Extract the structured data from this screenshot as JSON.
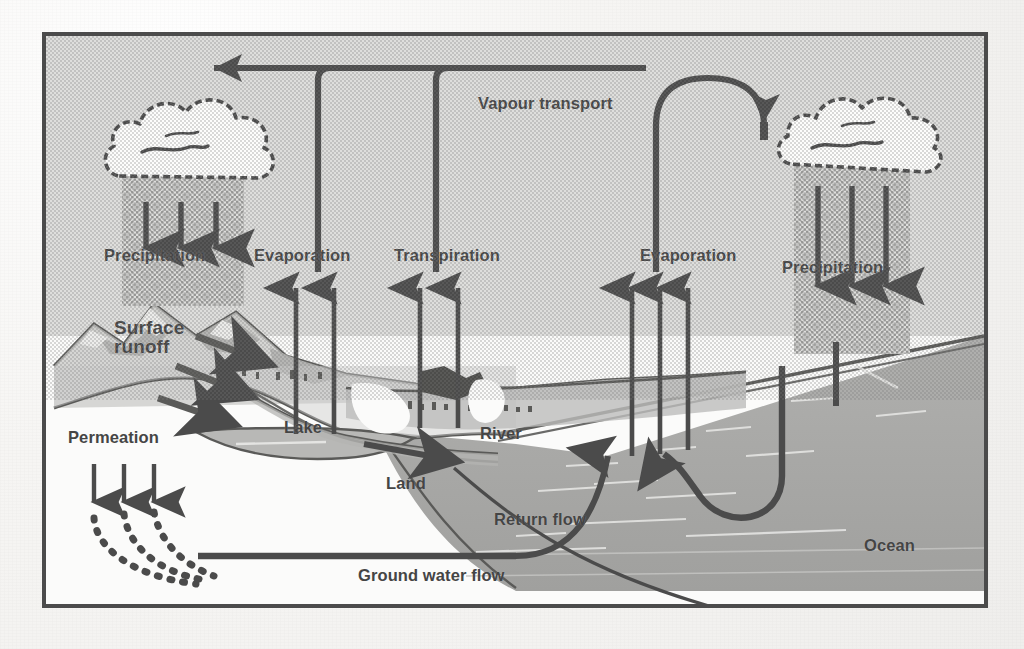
{
  "diagram": {
    "frame_border_color": "#4b4b4b",
    "sky_color": "#dededc",
    "land_color": "#fbfbfa",
    "water_color": "#a9a9a7",
    "ink_color": "#4b4b4b",
    "label_color": "#454545"
  },
  "labels": {
    "vapour_transport": "Vapour transport",
    "precipitation_left": "Precipitation",
    "evaporation_lake": "Evaporation",
    "transpiration": "Transpiration",
    "evaporation_ocean": "Evaporation",
    "precipitation_right": "Precipitation",
    "surface_runoff": "Surface\nrunoff",
    "permeation": "Permeation",
    "lake": "Lake",
    "land": "Land",
    "river": "River",
    "return_flow": "Return flow",
    "ground_water_flow": "Ground water flow",
    "ocean": "Ocean"
  },
  "icons": {
    "cloud_left": "cloud-icon",
    "cloud_right": "cloud-icon",
    "rain_shaft_left": "rain-shaft-icon",
    "rain_shaft_right": "rain-shaft-icon",
    "mountain": "mountain-icon",
    "arrow_vapour_left": "arrow-left-icon",
    "arrow_vapour_right": "arrow-down-icon"
  },
  "flows": [
    {
      "name": "precipitation-left",
      "label": "Precipitation",
      "direction": "down",
      "arrows": 3
    },
    {
      "name": "evaporation-lake",
      "label": "Evaporation",
      "direction": "up",
      "arrows": 2
    },
    {
      "name": "transpiration",
      "label": "Transpiration",
      "direction": "up",
      "arrows": 2
    },
    {
      "name": "evaporation-ocean",
      "label": "Evaporation",
      "direction": "up",
      "arrows": 3
    },
    {
      "name": "precipitation-right",
      "label": "Precipitation",
      "direction": "down",
      "arrows": 3
    },
    {
      "name": "vapour-transport",
      "label": "Vapour transport",
      "direction": "horizontal",
      "arrows": 2
    },
    {
      "name": "surface-runoff",
      "label": "Surface runoff",
      "direction": "downslope",
      "arrows": 3
    },
    {
      "name": "permeation",
      "label": "Permeation",
      "direction": "down",
      "arrows": 3
    },
    {
      "name": "return-flow",
      "label": "Return flow",
      "direction": "seaward",
      "arrows": 1
    },
    {
      "name": "ground-water-flow",
      "label": "Ground water flow",
      "direction": "seaward",
      "arrows": 0
    }
  ]
}
